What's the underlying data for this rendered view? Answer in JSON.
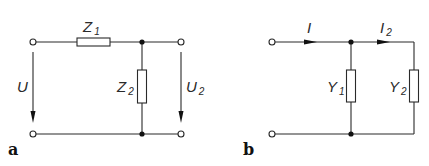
{
  "diagram": {
    "colors": {
      "line": "#2a2a2a",
      "node": "#111111",
      "background": "#ffffff"
    },
    "panels": [
      {
        "id": "a",
        "label": "a",
        "type": "voltage-divider",
        "components": [
          {
            "name": "Z",
            "sub": "1",
            "kind": "series-impedance"
          },
          {
            "name": "Z",
            "sub": "2",
            "kind": "shunt-impedance"
          }
        ],
        "voltages": [
          {
            "name": "U",
            "sub": "",
            "position": "input"
          },
          {
            "name": "U",
            "sub": "2",
            "position": "output"
          }
        ]
      },
      {
        "id": "b",
        "label": "b",
        "type": "current-divider",
        "components": [
          {
            "name": "Y",
            "sub": "1",
            "kind": "shunt-admittance"
          },
          {
            "name": "Y",
            "sub": "2",
            "kind": "shunt-admittance"
          }
        ],
        "currents": [
          {
            "name": "I",
            "sub": "",
            "position": "input"
          },
          {
            "name": "I",
            "sub": "2",
            "position": "branch"
          }
        ]
      }
    ]
  }
}
